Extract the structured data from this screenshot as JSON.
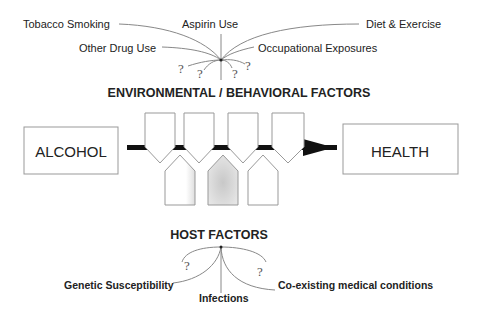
{
  "title": "Environmental / Behavioral Factors",
  "environmental": {
    "heading": "ENVIRONMENTAL / BEHAVIORAL  FACTORS",
    "factors": [
      {
        "label": "Tobacco Smoking"
      },
      {
        "label": "Aspirin Use"
      },
      {
        "label": "Diet & Exercise"
      },
      {
        "label": "Other Drug Use"
      },
      {
        "label": "Occupational Exposures"
      }
    ],
    "unknown_markers": [
      "?",
      "?",
      "?",
      "?"
    ]
  },
  "pathway": {
    "source": "ALCOHOL",
    "target": "HEALTH"
  },
  "host": {
    "heading": "HOST FACTORS",
    "factors": [
      {
        "label": "Genetic Susceptibility"
      },
      {
        "label": "Infections"
      },
      {
        "label": "Co-existing medical conditions"
      }
    ],
    "unknown_markers": [
      "?",
      "?"
    ]
  },
  "colors": {
    "line": "#888888",
    "box_border": "#999999",
    "arrow": "#111111",
    "text": "#222222"
  }
}
